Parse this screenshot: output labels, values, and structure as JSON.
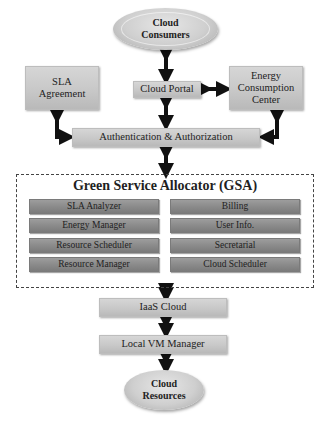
{
  "diagram": {
    "cloud_consumers": "Cloud Consumers",
    "cloud_portal": "Cloud Portal",
    "sla_agreement": "SLA Agreement",
    "energy_center": "Energy Consumption Center",
    "auth": "Authentication & Authorization",
    "gsa": {
      "title": "Green Service Allocator (GSA)",
      "left": [
        "SLA Analyzer",
        "Energy Manager",
        "Resource Scheduler",
        "Resource Manager"
      ],
      "right": [
        "Billing",
        "User Info.",
        "Secretarial",
        "Cloud Scheduler"
      ]
    },
    "iaas_cloud": "IaaS Cloud",
    "local_vm_manager": "Local VM Manager",
    "cloud_resources": "Cloud Resources"
  }
}
